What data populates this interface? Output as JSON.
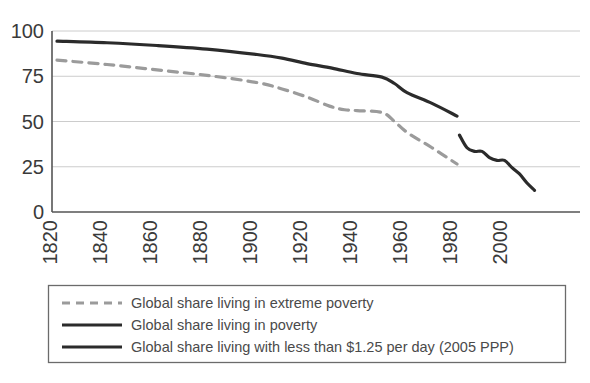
{
  "chart_data": {
    "type": "line",
    "title": "",
    "subtitle": "",
    "xlabel": "",
    "ylabel": "",
    "xlim": [
      1820,
      2012
    ],
    "ylim": [
      0,
      100
    ],
    "grid": true,
    "grid_axis": "y",
    "legend_position": "bottom",
    "xticks": [
      1820,
      1840,
      1860,
      1880,
      1900,
      1920,
      1940,
      1960,
      1980,
      2000
    ],
    "xtick_labels": [
      "1820",
      "1840",
      "1860",
      "1880",
      "1900",
      "1920",
      "1940",
      "1960",
      "1980",
      "2000"
    ],
    "xtick_rotation": 90,
    "yticks": [
      0,
      25,
      50,
      75,
      100
    ],
    "ytick_labels": [
      "0",
      "25",
      "50",
      "75",
      "100"
    ],
    "series": [
      {
        "name": "Global share living in extreme poverty",
        "style": "dashed",
        "color": "#9b9b9b",
        "width": 3.2,
        "x": [
          1820,
          1840,
          1860,
          1880,
          1900,
          1910,
          1920,
          1929,
          1935,
          1940,
          1950,
          1955,
          1960,
          1970,
          1980
        ],
        "y": [
          83.9,
          81.5,
          78.5,
          75.5,
          71.5,
          68.0,
          63.5,
          58.5,
          56.5,
          56.0,
          55.0,
          50.0,
          44.0,
          35.5,
          26.5
        ]
      },
      {
        "name": "Global share living in poverty",
        "style": "solid",
        "color": "#2b2b2b",
        "width": 3.2,
        "x": [
          1820,
          1840,
          1860,
          1880,
          1900,
          1910,
          1920,
          1930,
          1940,
          1950,
          1955,
          1960,
          1970,
          1980
        ],
        "y": [
          94.4,
          93.5,
          92.0,
          90.0,
          87.0,
          85.0,
          82.0,
          79.5,
          76.5,
          74.5,
          71.0,
          66.0,
          60.0,
          53.0
        ]
      },
      {
        "name": "Global share living with less than $1.25 per day (2005 PPP)",
        "style": "solid",
        "color": "#2b2b2b",
        "width": 3.2,
        "x": [
          1981,
          1984,
          1987,
          1990,
          1993,
          1996,
          1999,
          2002,
          2005,
          2008,
          2011
        ],
        "y": [
          42.5,
          35.5,
          33.5,
          33.5,
          30.0,
          28.5,
          28.5,
          24.5,
          21.0,
          16.0,
          12.0
        ]
      }
    ],
    "legend": [
      {
        "label": "Global share living in extreme poverty",
        "style": "dashed",
        "color": "#9b9b9b"
      },
      {
        "label": "Global share living in poverty",
        "style": "solid",
        "color": "#2b2b2b"
      },
      {
        "label": "Global share living with less than $1.25 per day (2005 PPP)",
        "style": "solid",
        "color": "#2b2b2b"
      }
    ]
  },
  "colors": {
    "axis": "#555555",
    "grid": "#cccccc",
    "solid_series": "#2b2b2b",
    "dashed_series": "#9b9b9b",
    "text": "#3a3a3a",
    "legend_border": "#6b6b6b",
    "background": "#ffffff"
  }
}
